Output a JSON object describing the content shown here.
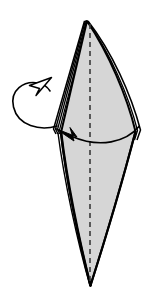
{
  "figure": {
    "title": "Origami step diagram: turn the model over / fold layer to the left",
    "type": "origami-instruction-diagram",
    "canvas": {
      "width": 160,
      "height": 306,
      "background": "#ffffff"
    },
    "colors": {
      "paper_fill": "#d6d6d6",
      "paper_outline": "#000000",
      "crease_line": "#3a3a3a",
      "arrow_stroke": "#000000",
      "arrowhead_fill": "#000000",
      "background": "#ffffff"
    },
    "shape": {
      "name": "kite-diamond-with-layered-left-edge",
      "description": "Tall narrow diamond (kite) with a curved right flank, apex at top, long point at bottom",
      "apex_top": {
        "x": 86,
        "y": 20
      },
      "left_widest": {
        "x": 57,
        "y": 131
      },
      "right_widest": {
        "x": 140,
        "y": 133
      },
      "bottom_point": {
        "x": 90,
        "y": 286
      },
      "layer_count_left": 4,
      "layer_count_right": 3
    },
    "crease": {
      "name": "vertical-center-crease",
      "style": "dashed",
      "x": 90,
      "y_start": 24,
      "y_end": 283,
      "dash_pattern": "5 4",
      "stroke_width": 1.6
    },
    "arrows": [
      {
        "name": "fold-over-arrow",
        "style": "solid-filled-arrowhead",
        "direction": "right-to-left",
        "description": "Broad curved arrow sweeping from the right widest point leftwards across the face",
        "start": {
          "x": 140,
          "y": 127
        },
        "end": {
          "x": 58,
          "y": 131
        },
        "arrowhead_at": "end"
      },
      {
        "name": "turn-over-loop-arrow",
        "style": "open-hollow-arrowhead",
        "direction": "counterclockwise-loop-behind",
        "description": "Elliptical loop wrapping around the left edge indicating the layer passes behind",
        "loop_center": {
          "x": 33,
          "y": 105
        },
        "loop_rx": 22,
        "loop_ry": 23,
        "arrowhead_at": "top-right-of-loop",
        "arrowhead_tip": {
          "x": 47,
          "y": 80
        }
      }
    ]
  }
}
